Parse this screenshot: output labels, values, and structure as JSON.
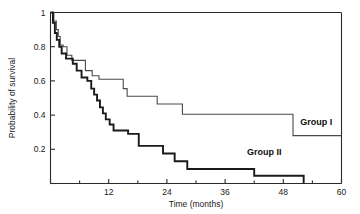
{
  "chart_data": {
    "type": "line",
    "subtype": "kaplan-meier-step",
    "title": "",
    "xlabel": "Time (months)",
    "ylabel": "Probability of survival",
    "xlim": [
      0,
      60
    ],
    "ylim": [
      0,
      1
    ],
    "grid": false,
    "legend_position": "inline-right",
    "x_ticks_major": [
      0,
      12,
      24,
      36,
      48,
      60
    ],
    "x_ticks_minor": [
      6,
      18,
      30,
      42,
      54
    ],
    "x_tick_labels": [
      "",
      "12",
      "24",
      "36",
      "48",
      "60"
    ],
    "y_ticks": [
      0,
      0.2,
      0.4,
      0.6,
      0.8,
      1
    ],
    "y_tick_labels": [
      "",
      "0.2",
      "0.4",
      "0.6",
      "0.8",
      "1"
    ],
    "series": [
      {
        "name": "Group  I",
        "color": "#4a4a4a",
        "line_width": 1.1,
        "label_x": 51.5,
        "label_y": 0.345,
        "points": [
          [
            0,
            1.0
          ],
          [
            0.7,
            0.95
          ],
          [
            1.2,
            0.9
          ],
          [
            1.6,
            0.86
          ],
          [
            2.0,
            0.81
          ],
          [
            2.6,
            0.8
          ],
          [
            3.4,
            0.75
          ],
          [
            4.4,
            0.72
          ],
          [
            6.6,
            0.72
          ],
          [
            7.2,
            0.66
          ],
          [
            8.6,
            0.63
          ],
          [
            10.0,
            0.61
          ],
          [
            14.4,
            0.61
          ],
          [
            15.0,
            0.555
          ],
          [
            15.8,
            0.51
          ],
          [
            21.4,
            0.51
          ],
          [
            22.0,
            0.465
          ],
          [
            26.4,
            0.465
          ],
          [
            27.2,
            0.405
          ],
          [
            49.4,
            0.405
          ],
          [
            50.0,
            0.28
          ],
          [
            60,
            0.28
          ]
        ]
      },
      {
        "name": "Group  II",
        "color": "#1a1a1a",
        "line_width": 1.9,
        "label_x": 40.5,
        "label_y": 0.165,
        "points": [
          [
            0,
            1.0
          ],
          [
            0.5,
            0.94
          ],
          [
            0.9,
            0.88
          ],
          [
            1.3,
            0.84
          ],
          [
            1.8,
            0.8
          ],
          [
            2.3,
            0.76
          ],
          [
            3.2,
            0.73
          ],
          [
            4.6,
            0.7
          ],
          [
            5.4,
            0.66
          ],
          [
            6.4,
            0.62
          ],
          [
            7.6,
            0.6
          ],
          [
            8.4,
            0.555
          ],
          [
            9.0,
            0.52
          ],
          [
            9.6,
            0.485
          ],
          [
            10.2,
            0.445
          ],
          [
            10.8,
            0.41
          ],
          [
            11.4,
            0.375
          ],
          [
            12.2,
            0.345
          ],
          [
            13.0,
            0.31
          ],
          [
            15.4,
            0.31
          ],
          [
            16.0,
            0.29
          ],
          [
            17.6,
            0.29
          ],
          [
            18.2,
            0.22
          ],
          [
            22.6,
            0.22
          ],
          [
            23.2,
            0.175
          ],
          [
            25.0,
            0.175
          ],
          [
            25.6,
            0.13
          ],
          [
            27.6,
            0.13
          ],
          [
            28.2,
            0.085
          ],
          [
            41.4,
            0.085
          ],
          [
            42.0,
            0.045
          ],
          [
            51.6,
            0.045
          ],
          [
            52.2,
            0.0
          ]
        ]
      }
    ]
  }
}
